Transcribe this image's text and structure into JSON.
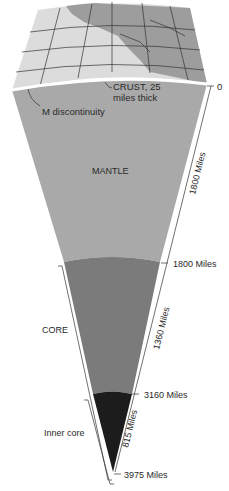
{
  "diagram": {
    "layers": [
      {
        "name": "crust",
        "label": "CRUST, 25",
        "label2": "miles thick",
        "color": "#d9d9d9"
      },
      {
        "name": "mantle",
        "label": "MANTLE",
        "color": "#a9a9a9"
      },
      {
        "name": "core",
        "label": "CORE",
        "color": "#7b7b7b"
      },
      {
        "name": "inner-core",
        "label": "Inner core",
        "color": "#1c1c1c"
      }
    ],
    "boundary_label": "M discontinuity",
    "depths": {
      "surface": "0",
      "mantle_bottom": "1800 Miles",
      "core_top": "3160 Miles",
      "center": "3975 Miles"
    },
    "thickness": {
      "mantle": "1800 Miles",
      "core": "1360 Miles",
      "inner_core": "815 Miles"
    },
    "colors": {
      "map_land": "#9a9a9a",
      "map_sea": "#dcdcdc",
      "grid": "#333333",
      "crust_line": "#ffffff"
    }
  }
}
